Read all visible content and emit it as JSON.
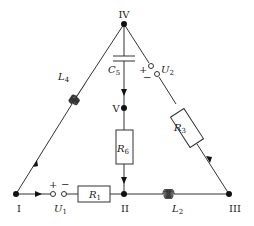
{
  "nodes": {
    "I": {
      "label": "I",
      "x": 16,
      "y": 194
    },
    "II": {
      "label": "II",
      "x": 124,
      "y": 194
    },
    "III": {
      "label": "III",
      "x": 229,
      "y": 194
    },
    "IV": {
      "label": "IV",
      "x": 124,
      "y": 24
    },
    "V": {
      "label": "V",
      "x": 124,
      "y": 108
    }
  },
  "components": {
    "R1": {
      "main": "R",
      "sub": "1",
      "type": "resistor",
      "between": [
        "I",
        "II"
      ]
    },
    "L2": {
      "main": "L",
      "sub": "2",
      "type": "inductor",
      "between": [
        "II",
        "III"
      ]
    },
    "R3": {
      "main": "R",
      "sub": "3",
      "type": "resistor",
      "between": [
        "III",
        "IV"
      ]
    },
    "L4": {
      "main": "L",
      "sub": "4",
      "type": "inductor",
      "between": [
        "I",
        "IV"
      ]
    },
    "C5": {
      "main": "C",
      "sub": "5",
      "type": "capacitor",
      "between": [
        "IV",
        "V"
      ]
    },
    "R6": {
      "main": "R",
      "sub": "6",
      "type": "resistor",
      "between": [
        "V",
        "II"
      ]
    },
    "U1": {
      "main": "U",
      "sub": "1",
      "type": "voltage-source",
      "plus": "+",
      "minus": "−",
      "between": [
        "I",
        "II"
      ]
    },
    "U2": {
      "main": "U",
      "sub": "2",
      "type": "voltage-source",
      "plus": "+",
      "minus": "−",
      "between": [
        "IV",
        "III"
      ]
    }
  },
  "colors": {
    "wire": "#333333",
    "node": "#111111",
    "background": "#ffffff"
  }
}
